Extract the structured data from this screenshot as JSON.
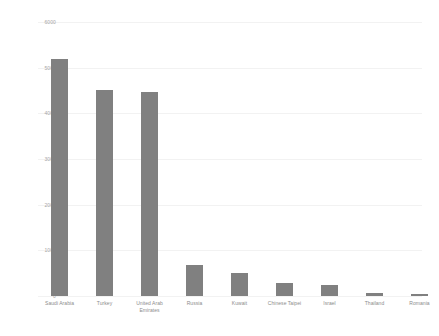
{
  "chart_data": {
    "type": "bar",
    "title": "",
    "subtitle": "",
    "xlabel": "",
    "ylabel": "",
    "categories": [
      "Saudi Arabia",
      "Turkey",
      "United Arab Emirates",
      "Russia",
      "Kuwait",
      "Chinese Taipei",
      "Israel",
      "Thailand",
      "Romania"
    ],
    "values": [
      5200,
      4520,
      4470,
      680,
      500,
      285,
      240,
      55,
      45
    ],
    "ylim": [
      0,
      6000
    ],
    "ytick_labels": [
      "6000",
      "5000",
      "4000",
      "3000",
      "2000",
      "1000",
      "0"
    ],
    "ytick_values": [
      6000,
      5000,
      4000,
      3000,
      2000,
      1000,
      0
    ],
    "grid": true,
    "grid_axis": "y",
    "legend": false,
    "legend_position": "none",
    "series": [
      {
        "name": "",
        "values": [
          5200,
          4520,
          4470,
          680,
          500,
          285,
          240,
          55,
          45
        ]
      }
    ],
    "colors": {
      "bar": "#808080",
      "gridline": "#f2f2f2",
      "tick_text": "#a6a6a6",
      "category_text": "#8c8c8c",
      "background": "#ffffff"
    }
  }
}
